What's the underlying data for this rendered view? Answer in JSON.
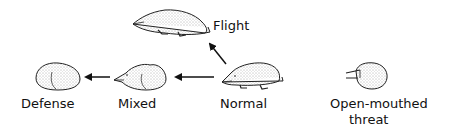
{
  "figure": {
    "states": [
      {
        "id": "flight",
        "label": "Flight"
      },
      {
        "id": "defense",
        "label": "Defense"
      },
      {
        "id": "mixed",
        "label": "Mixed"
      },
      {
        "id": "normal",
        "label": "Normal"
      },
      {
        "id": "threat",
        "label_line1": "Open-mouthed",
        "label_line2": "threat"
      }
    ],
    "arrows": [
      {
        "from": "normal",
        "to": "flight"
      },
      {
        "from": "normal",
        "to": "mixed"
      },
      {
        "from": "mixed",
        "to": "defense"
      }
    ]
  }
}
